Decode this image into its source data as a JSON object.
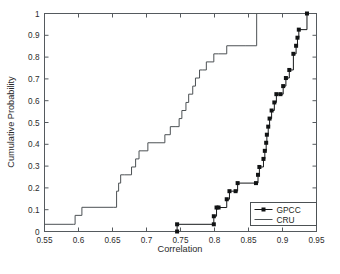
{
  "figure": {
    "background_color": "#ffffff",
    "axis_color": "#555a5e",
    "caption_fragment": ""
  },
  "chart_data": {
    "type": "line",
    "title": "",
    "xlabel": "Correlation",
    "ylabel": "Cumulative Probability",
    "xlim": [
      0.55,
      0.95
    ],
    "ylim": [
      0,
      1
    ],
    "grid": false,
    "legend_position": "lower right",
    "xticks": [
      0.55,
      0.6,
      0.65,
      0.7,
      0.75,
      0.8,
      0.85,
      0.9,
      0.95
    ],
    "xticklabels": [
      "0.55",
      "0.6",
      "0.65",
      "0.7",
      "0.75",
      "0.8",
      "0.85",
      "0.9",
      "0.95"
    ],
    "yticks": [
      0,
      0.1,
      0.2,
      0.3,
      0.4,
      0.5,
      0.6,
      0.7,
      0.8,
      0.9,
      1
    ],
    "yticklabels": [
      "0",
      "0.1",
      "0.2",
      "0.3",
      "0.4",
      "0.5",
      "0.6",
      "0.7",
      "0.8",
      "0.9",
      "1"
    ],
    "series": [
      {
        "name": "GPCC",
        "style": "step-marker",
        "color": "#16181a",
        "marker": "square",
        "x": [
          0.745,
          0.745,
          0.799,
          0.799,
          0.803,
          0.806,
          0.818,
          0.822,
          0.831,
          0.834,
          0.861,
          0.864,
          0.866,
          0.872,
          0.874,
          0.876,
          0.877,
          0.879,
          0.881,
          0.884,
          0.888,
          0.891,
          0.897,
          0.901,
          0.905,
          0.91,
          0.916,
          0.92,
          0.922,
          0.924,
          0.936
        ],
        "y": [
          0.0,
          0.033,
          0.033,
          0.07,
          0.11,
          0.11,
          0.148,
          0.185,
          0.185,
          0.222,
          0.222,
          0.26,
          0.296,
          0.333,
          0.37,
          0.407,
          0.444,
          0.481,
          0.518,
          0.555,
          0.592,
          0.63,
          0.63,
          0.667,
          0.704,
          0.741,
          0.815,
          0.852,
          0.889,
          0.926,
          1.0
        ]
      },
      {
        "name": "CRU",
        "style": "step",
        "color": "#4c5154",
        "marker": "none",
        "x": [
          0.55,
          0.593,
          0.595,
          0.605,
          0.651,
          0.656,
          0.659,
          0.662,
          0.668,
          0.678,
          0.684,
          0.689,
          0.692,
          0.702,
          0.714,
          0.727,
          0.735,
          0.742,
          0.748,
          0.752,
          0.758,
          0.762,
          0.768,
          0.772,
          0.778,
          0.782,
          0.788,
          0.792,
          0.799,
          0.806,
          0.818,
          0.845,
          0.861,
          0.862
        ],
        "y": [
          0.033,
          0.033,
          0.074,
          0.111,
          0.111,
          0.185,
          0.222,
          0.26,
          0.26,
          0.296,
          0.333,
          0.37,
          0.37,
          0.407,
          0.407,
          0.444,
          0.481,
          0.481,
          0.518,
          0.555,
          0.592,
          0.63,
          0.667,
          0.704,
          0.741,
          0.741,
          0.778,
          0.778,
          0.815,
          0.815,
          0.852,
          0.852,
          0.852,
          1.0
        ]
      }
    ],
    "legend": [
      {
        "label": "GPCC",
        "marker": "square",
        "color": "#16181a"
      },
      {
        "label": "CRU",
        "marker": "none",
        "color": "#4c5154"
      }
    ]
  }
}
